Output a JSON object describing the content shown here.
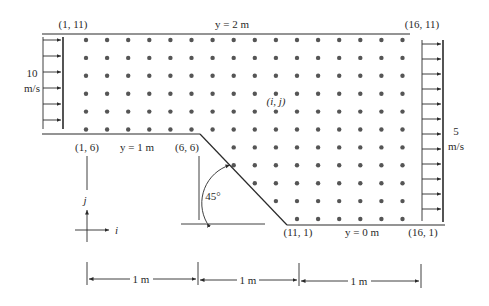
{
  "figure": {
    "corner_labels": {
      "top_left": "(1, 11)",
      "top_right": "(16, 11)",
      "step_left": "(1, 6)",
      "step_corner": "(6, 6)",
      "bottom_left": "(11, 1)",
      "bottom_right": "(16, 1)"
    },
    "boundary_labels": {
      "top": "y = 2 m",
      "step": "y = 1 m",
      "bottom": "y = 0 m"
    },
    "inlet": {
      "value": "10",
      "unit": "m/s"
    },
    "outlet": {
      "value": "5",
      "unit": "m/s"
    },
    "node_label": "(i, j)",
    "angle_label": "45°",
    "axes": {
      "i": "i",
      "j": "j"
    },
    "dimensions": [
      "1 m",
      "1 m",
      "1 m"
    ],
    "colors": {
      "line": "#2a2a2a",
      "dot": "#555555"
    }
  }
}
